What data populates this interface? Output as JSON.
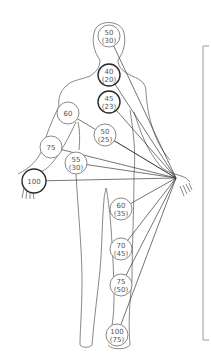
{
  "diagram": {
    "focal_point": {
      "name": "right-hand",
      "x": 176,
      "y": 178
    },
    "nodes": [
      {
        "id": "head",
        "x": 109,
        "y": 36,
        "r": 11,
        "top": "50",
        "bottom": "(30)",
        "bold": false
      },
      {
        "id": "neck",
        "x": 109,
        "y": 75,
        "r": 11,
        "top": "40",
        "bottom": "(20)",
        "bold": true
      },
      {
        "id": "chest",
        "x": 109,
        "y": 102,
        "r": 11,
        "top": "45",
        "bottom": "(23)",
        "bold": true
      },
      {
        "id": "abdomen",
        "x": 105,
        "y": 135,
        "r": 11,
        "top": "50",
        "bottom": "(25)",
        "bold": false
      },
      {
        "id": "left-upper-arm",
        "x": 68,
        "y": 113,
        "r": 11,
        "top": "60",
        "bottom": "",
        "bold": false
      },
      {
        "id": "left-forearm",
        "x": 51,
        "y": 147,
        "r": 11,
        "top": "75",
        "bottom": "",
        "bold": false
      },
      {
        "id": "left-hip",
        "x": 76,
        "y": 163,
        "r": 11,
        "top": "55",
        "bottom": "(30)",
        "bold": false
      },
      {
        "id": "left-hand",
        "x": 34,
        "y": 181,
        "r": 12,
        "top": "100",
        "bottom": "",
        "bold": true
      },
      {
        "id": "right-thigh",
        "x": 121,
        "y": 209,
        "r": 11,
        "top": "60",
        "bottom": "(35)",
        "bold": false
      },
      {
        "id": "right-knee",
        "x": 121,
        "y": 249,
        "r": 11,
        "top": "70",
        "bottom": "(45)",
        "bold": false
      },
      {
        "id": "right-shin",
        "x": 121,
        "y": 285,
        "r": 11,
        "top": "75",
        "bottom": "(50)",
        "bold": false
      },
      {
        "id": "right-foot",
        "x": 117,
        "y": 335,
        "r": 11,
        "top": "100",
        "bottom": "(75)",
        "bold": false
      }
    ]
  }
}
